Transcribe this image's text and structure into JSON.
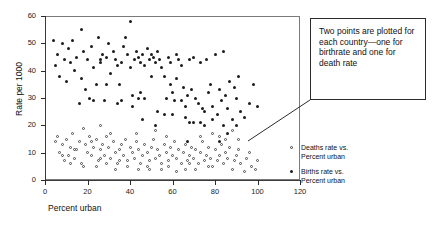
{
  "chart_data": {
    "type": "scatter",
    "title": "",
    "xlabel": "Percent urban",
    "ylabel": "Rate per 1000",
    "xlim": [
      0,
      120
    ],
    "ylim": [
      0,
      60
    ],
    "xticks": [
      0,
      20,
      40,
      60,
      80,
      100,
      120
    ],
    "yticks": [
      0,
      10,
      20,
      30,
      40,
      50,
      60
    ],
    "grid": false,
    "legend_position": "right",
    "annotation": "Two points are plotted for each country—one for birthrate and one for death rate",
    "series": [
      {
        "name": "Deaths rate vs. Percent urban",
        "marker": "open-circle",
        "color": "#4a4a4a",
        "points": [
          [
            5,
            14
          ],
          [
            6,
            16
          ],
          [
            7,
            10
          ],
          [
            8,
            13
          ],
          [
            9,
            7
          ],
          [
            10,
            15
          ],
          [
            11,
            9
          ],
          [
            12,
            12
          ],
          [
            13,
            17
          ],
          [
            14,
            8
          ],
          [
            15,
            11
          ],
          [
            16,
            14
          ],
          [
            17,
            6
          ],
          [
            18,
            19
          ],
          [
            19,
            13
          ],
          [
            20,
            10
          ],
          [
            21,
            16
          ],
          [
            22,
            9
          ],
          [
            23,
            12
          ],
          [
            24,
            15
          ],
          [
            25,
            7
          ],
          [
            26,
            20
          ],
          [
            26,
            11
          ],
          [
            27,
            13
          ],
          [
            28,
            9
          ],
          [
            29,
            16
          ],
          [
            30,
            12
          ],
          [
            31,
            8
          ],
          [
            32,
            14
          ],
          [
            33,
            10
          ],
          [
            34,
            6
          ],
          [
            35,
            11
          ],
          [
            36,
            13
          ],
          [
            37,
            9
          ],
          [
            38,
            15
          ],
          [
            39,
            7
          ],
          [
            40,
            12
          ],
          [
            41,
            10
          ],
          [
            42,
            8
          ],
          [
            43,
            14
          ],
          [
            44,
            11
          ],
          [
            45,
            6
          ],
          [
            46,
            9
          ],
          [
            47,
            13
          ],
          [
            48,
            10
          ],
          [
            49,
            7
          ],
          [
            50,
            12
          ],
          [
            51,
            15
          ],
          [
            52,
            8
          ],
          [
            53,
            11
          ],
          [
            54,
            9
          ],
          [
            55,
            6
          ],
          [
            56,
            13
          ],
          [
            57,
            10
          ],
          [
            58,
            7
          ],
          [
            59,
            12
          ],
          [
            60,
            9
          ],
          [
            61,
            14
          ],
          [
            62,
            8
          ],
          [
            63,
            11
          ],
          [
            64,
            6
          ],
          [
            65,
            10
          ],
          [
            66,
            13
          ],
          [
            67,
            7
          ],
          [
            68,
            9
          ],
          [
            69,
            12
          ],
          [
            70,
            8
          ],
          [
            71,
            11
          ],
          [
            72,
            6
          ],
          [
            73,
            10
          ],
          [
            74,
            14
          ],
          [
            75,
            7
          ],
          [
            76,
            9
          ],
          [
            77,
            12
          ],
          [
            78,
            8
          ],
          [
            79,
            5
          ],
          [
            80,
            11
          ],
          [
            81,
            7
          ],
          [
            82,
            16
          ],
          [
            82,
            9
          ],
          [
            83,
            13
          ],
          [
            84,
            6
          ],
          [
            85,
            10
          ],
          [
            86,
            8
          ],
          [
            87,
            12
          ],
          [
            88,
            4
          ],
          [
            89,
            7
          ],
          [
            90,
            9
          ],
          [
            91,
            11
          ],
          [
            92,
            6
          ],
          [
            94,
            3
          ],
          [
            95,
            8
          ],
          [
            96,
            10
          ],
          [
            97,
            5
          ],
          [
            99,
            4
          ],
          [
            100,
            7
          ],
          [
            24,
            5
          ],
          [
            33,
            4
          ],
          [
            44,
            4
          ],
          [
            55,
            4
          ],
          [
            62,
            3
          ],
          [
            71,
            4
          ],
          [
            26,
            8
          ],
          [
            35,
            7
          ],
          [
            48,
            5
          ],
          [
            58,
            5
          ],
          [
            66,
            4
          ],
          [
            77,
            5
          ],
          [
            12,
            6
          ],
          [
            18,
            5
          ],
          [
            29,
            6
          ],
          [
            39,
            5
          ],
          [
            49,
            4
          ],
          [
            68,
            6
          ],
          [
            8,
            9
          ],
          [
            14,
            11
          ],
          [
            22,
            14
          ],
          [
            31,
            17
          ],
          [
            43,
            17
          ],
          [
            52,
            18
          ],
          [
            57,
            16
          ],
          [
            73,
            16
          ],
          [
            79,
            17
          ],
          [
            85,
            15
          ],
          [
            91,
            15
          ],
          [
            88,
            18
          ]
        ]
      },
      {
        "name": "Births rate vs. Percent urban",
        "marker": "filled-circle",
        "color": "#1c1c1c",
        "points": [
          [
            4,
            51
          ],
          [
            5,
            42
          ],
          [
            6,
            46
          ],
          [
            7,
            38
          ],
          [
            8,
            50
          ],
          [
            9,
            44
          ],
          [
            10,
            36
          ],
          [
            11,
            48
          ],
          [
            12,
            43
          ],
          [
            13,
            51
          ],
          [
            14,
            40
          ],
          [
            15,
            45
          ],
          [
            16,
            28
          ],
          [
            17,
            37
          ],
          [
            18,
            47
          ],
          [
            19,
            33
          ],
          [
            20,
            44
          ],
          [
            21,
            30
          ],
          [
            22,
            49
          ],
          [
            23,
            41
          ],
          [
            24,
            35
          ],
          [
            25,
            52
          ],
          [
            26,
            44
          ],
          [
            26,
            43
          ],
          [
            27,
            46
          ],
          [
            28,
            29
          ],
          [
            29,
            45
          ],
          [
            30,
            50
          ],
          [
            31,
            39
          ],
          [
            32,
            47
          ],
          [
            33,
            44
          ],
          [
            34,
            28
          ],
          [
            35,
            35
          ],
          [
            36,
            43
          ],
          [
            37,
            49
          ],
          [
            38,
            52
          ],
          [
            39,
            46
          ],
          [
            40,
            41
          ],
          [
            41,
            31
          ],
          [
            42,
            44
          ],
          [
            43,
            47
          ],
          [
            44,
            45
          ],
          [
            45,
            43
          ],
          [
            46,
            46
          ],
          [
            47,
            42
          ],
          [
            48,
            48
          ],
          [
            49,
            44
          ],
          [
            50,
            46
          ],
          [
            51,
            45
          ],
          [
            52,
            43
          ],
          [
            53,
            47
          ],
          [
            54,
            44
          ],
          [
            55,
            41
          ],
          [
            56,
            38
          ],
          [
            57,
            30
          ],
          [
            58,
            45
          ],
          [
            59,
            43
          ],
          [
            60,
            32
          ],
          [
            61,
            29
          ],
          [
            62,
            46
          ],
          [
            63,
            44
          ],
          [
            64,
            42
          ],
          [
            65,
            34
          ],
          [
            66,
            27
          ],
          [
            67,
            31
          ],
          [
            68,
            44
          ],
          [
            69,
            33
          ],
          [
            70,
            45
          ],
          [
            71,
            30
          ],
          [
            72,
            28
          ],
          [
            73,
            43
          ],
          [
            74,
            26
          ],
          [
            75,
            25
          ],
          [
            76,
            44
          ],
          [
            77,
            32
          ],
          [
            78,
            35
          ],
          [
            79,
            27
          ],
          [
            80,
            46
          ],
          [
            81,
            24
          ],
          [
            82,
            33
          ],
          [
            83,
            29
          ],
          [
            84,
            47
          ],
          [
            85,
            31
          ],
          [
            86,
            26
          ],
          [
            87,
            36
          ],
          [
            88,
            22
          ],
          [
            89,
            34
          ],
          [
            90,
            30
          ],
          [
            91,
            38
          ],
          [
            92,
            25
          ],
          [
            94,
            23
          ],
          [
            96,
            28
          ],
          [
            98,
            35
          ],
          [
            100,
            27
          ],
          [
            17,
            55
          ],
          [
            40,
            58
          ],
          [
            45,
            32
          ],
          [
            50,
            38
          ],
          [
            53,
            25
          ],
          [
            60,
            24
          ],
          [
            66,
            23
          ],
          [
            70,
            21
          ],
          [
            73,
            21
          ],
          [
            75,
            20
          ],
          [
            79,
            22
          ],
          [
            84,
            20
          ],
          [
            29,
            35
          ],
          [
            34,
            42
          ],
          [
            44,
            30
          ],
          [
            47,
            30
          ],
          [
            56,
            24
          ],
          [
            62,
            37
          ],
          [
            64,
            29
          ],
          [
            68,
            21
          ],
          [
            46,
            22
          ],
          [
            52,
            20
          ],
          [
            67,
            14
          ],
          [
            82,
            14
          ],
          [
            86,
            17
          ],
          [
            90,
            20
          ],
          [
            36,
            29
          ],
          [
            41,
            27
          ],
          [
            59,
            35
          ],
          [
            23,
            29
          ]
        ]
      }
    ]
  },
  "axis": {
    "y_tick_labels": [
      "0",
      "10",
      "20",
      "30",
      "40",
      "50",
      "60"
    ],
    "x_tick_labels": [
      "0",
      "20",
      "40",
      "60",
      "80",
      "100",
      "120"
    ],
    "y_title": "Rate per 1000",
    "x_title": "Percent urban"
  },
  "legend": {
    "entries": [
      {
        "label_line1": "Deaths rate vs.",
        "label_line2": "Percent urban",
        "marker": "open-circle"
      },
      {
        "label_line1": "Births rate vs.",
        "label_line2": "Percent urban",
        "marker": "filled-circle"
      }
    ]
  },
  "callout": {
    "text": "Two points are plotted for each country—one for birthrate and one for death rate"
  }
}
